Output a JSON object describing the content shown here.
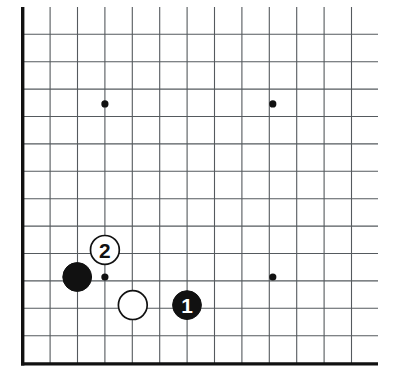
{
  "figure": {
    "kind": "go-board-diagram",
    "title": "",
    "board_size": 19,
    "view": "bottom-left corner",
    "background_color": "#ffffff",
    "line_color": "#555a5e",
    "border_color": "#111111",
    "black_stone_color": "#111111",
    "white_stone_color": "#ffffff"
  },
  "board": {
    "origin_x": 22.7,
    "origin_y": 6.9,
    "spacing": 27.4,
    "cols": 13,
    "rows": 14,
    "grid_line_width": 1.1,
    "border_line_width": 3.4,
    "left_border_x": 22.7,
    "bottom_border_y": 363.9,
    "grid_right_x": 378.0,
    "grid_top_y": 6.9,
    "vertical_line_x": [
      22.7,
      50.1,
      77.5,
      104.9,
      132.3,
      159.7,
      187.1,
      214.5,
      241.9,
      269.3,
      296.7,
      324.1,
      351.5
    ],
    "horizontal_line_y": [
      34.3,
      61.7,
      89.1,
      116.5,
      143.9,
      171.3,
      198.7,
      226.1,
      253.5,
      280.9,
      308.3,
      335.7,
      363.9
    ]
  },
  "star_points": [
    {
      "name": "star-point-upper-left",
      "x": 104.9,
      "y": 103.9,
      "r": 3.6
    },
    {
      "name": "star-point-upper-right",
      "x": 272.8,
      "y": 103.9,
      "r": 3.6
    },
    {
      "name": "star-point-lower-right",
      "x": 272.8,
      "y": 277.0,
      "r": 3.6
    },
    {
      "name": "star-point-lower-left",
      "x": 104.9,
      "y": 277.0,
      "r": 3.6
    }
  ],
  "stones": [
    {
      "name": "black-stone-corner",
      "color": "black",
      "label": "",
      "x": 77.2,
      "y": 277.0,
      "r": 14.4
    },
    {
      "name": "white-stone-move-2",
      "color": "white",
      "label": "2",
      "x": 104.9,
      "y": 249.9,
      "r": 14.4
    },
    {
      "name": "white-stone-plain",
      "color": "white",
      "label": "",
      "x": 132.8,
      "y": 305.1,
      "r": 14.4
    },
    {
      "name": "black-stone-move-1",
      "color": "black",
      "label": "1",
      "x": 187.0,
      "y": 305.1,
      "r": 14.4
    }
  ],
  "labels": {
    "move_one": "1",
    "move_two": "2"
  }
}
